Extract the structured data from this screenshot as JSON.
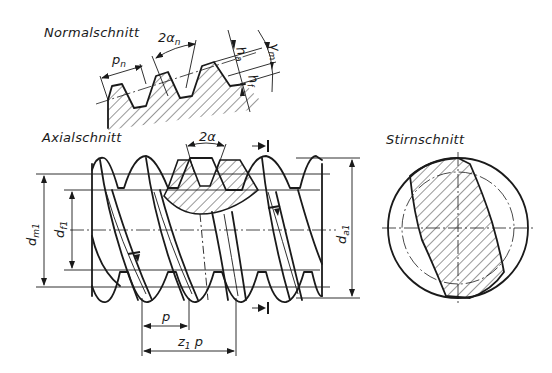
{
  "figure": {
    "type": "technical-drawing"
  },
  "views": {
    "normal": {
      "title": "Normalschnitt",
      "labels": {
        "pitch": "p",
        "pitch_sub": "n",
        "angle": "2α",
        "angle_sub": "n",
        "addendum": "h",
        "addendum_sub": "a",
        "dedendum": "h",
        "dedendum_sub": "f",
        "lead_angle": "γ",
        "lead_angle_sub": "m"
      }
    },
    "axial": {
      "title": "Axialschnitt",
      "labels": {
        "angle": "2α",
        "mean_diameter": "d",
        "mean_diameter_sub": "m1",
        "root_diameter": "d",
        "root_diameter_sub": "f1",
        "tip_diameter": "d",
        "tip_diameter_sub": "a1",
        "axial_pitch": "p",
        "lead": "z",
        "lead_sub": "1",
        "lead_suffix": " p"
      }
    },
    "transverse": {
      "title": "Stirnschnitt"
    }
  },
  "colors": {
    "ink": "#1a1a1a",
    "background": "#ffffff"
  }
}
